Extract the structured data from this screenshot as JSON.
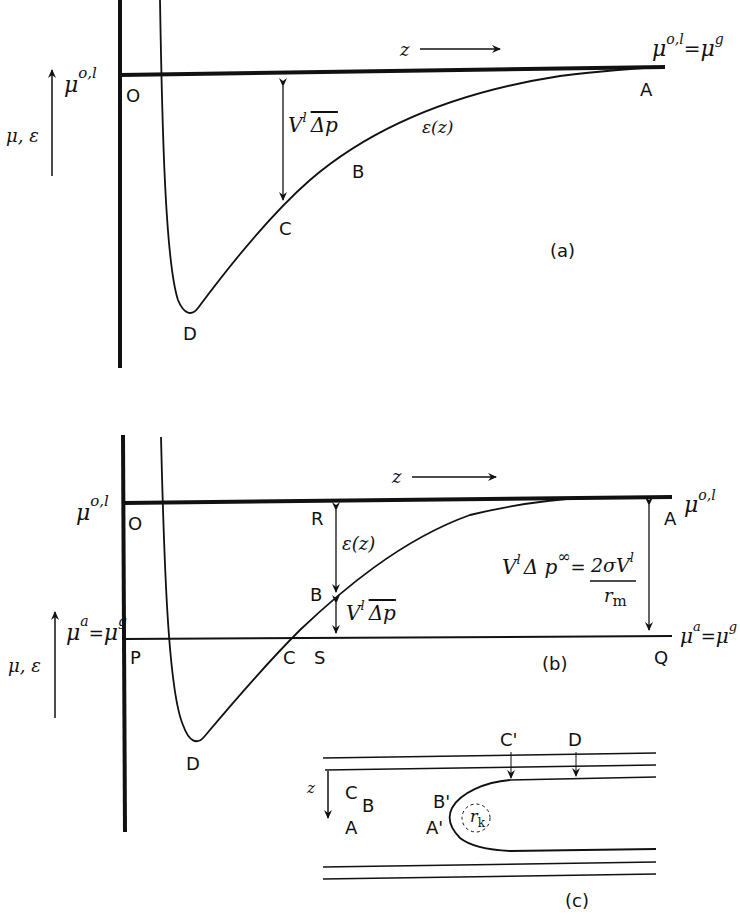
{
  "figure": {
    "panels": [
      {
        "id": "a",
        "caption": "(a)",
        "y_axis_label": "μ, ε",
        "top_level_label": "μ",
        "top_level_sup": "o,l",
        "right_level_label": "μ",
        "right_level_sup": "o,l",
        "right_level_eq": "=",
        "right_level_label2": "μ",
        "right_level_sup2": "g",
        "z_label": "z",
        "curve_label": "ε(z)",
        "arrow_label_main": "V",
        "arrow_label_sup": "l",
        "arrow_label_bar": "Δp",
        "points": {
          "O": "O",
          "A": "A",
          "B": "B",
          "C": "C",
          "D": "D"
        }
      },
      {
        "id": "b",
        "caption": "(b)",
        "y_axis_label": "μ, ε",
        "top_level_label": "μ",
        "top_level_sup": "o,l",
        "right_top_label": "μ",
        "right_top_sup": "o,l",
        "lower_level_label": "μ",
        "lower_level_sup": "a",
        "lower_level_eq": "=",
        "lower_level_label2": "μ",
        "lower_level_sup2": "g",
        "right_lower_label": "μ",
        "right_lower_sup": "a",
        "right_lower_eq": "=",
        "right_lower_label2": "μ",
        "right_lower_sup2": "g",
        "z_label": "z",
        "eps_label": "ε(z)",
        "bar_label_main": "V",
        "bar_label_sup": "l",
        "bar_label_bar": "Δp",
        "eq_lhs_V": "V",
        "eq_lhs_sup": "l",
        "eq_lhs_dp": "Δ p",
        "eq_lhs_inf": "∞",
        "eq_equals": "=",
        "eq_num": "2σV",
        "eq_num_sup": "l",
        "eq_den": "r",
        "eq_den_sub": "m",
        "points": {
          "O": "O",
          "R": "R",
          "B": "B",
          "P": "P",
          "C": "C",
          "S": "S",
          "Q": "Q",
          "A": "A",
          "D": "D"
        }
      },
      {
        "id": "c",
        "caption": "(c)",
        "z_label": "z",
        "points": {
          "C": "C",
          "B": "B",
          "A": "A",
          "B_prime": "B'",
          "A_prime": "A'",
          "C_prime": "C'",
          "D": "D"
        },
        "radius_label": "r",
        "radius_sub": "k"
      }
    ]
  }
}
